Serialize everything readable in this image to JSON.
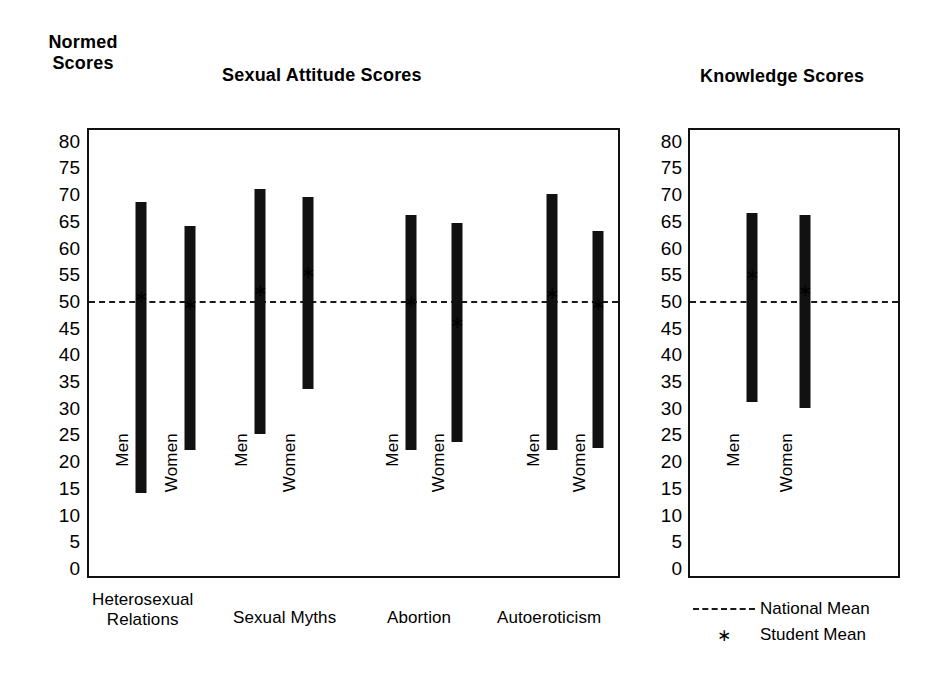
{
  "axis_title": "Normed\nScores",
  "panels": {
    "left": {
      "title": "Sexual Attitude Scores"
    },
    "right": {
      "title": "Knowledge Scores"
    }
  },
  "legend": {
    "national": {
      "label": "National Mean",
      "key": "dashed-line"
    },
    "student": {
      "label": "Student Mean",
      "key": "∗"
    }
  },
  "group_labels": {
    "men": "Men",
    "women": "Women"
  },
  "chart_data": {
    "type": "bar",
    "title": "Normed Scores",
    "ylabel": "Normed Scores",
    "xlabel": "",
    "ylim": [
      0,
      82
    ],
    "grid": false,
    "legend_position": "bottom-right",
    "yticks": [
      80,
      75,
      70,
      65,
      60,
      55,
      50,
      45,
      40,
      35,
      30,
      25,
      20,
      15,
      10,
      5,
      0
    ],
    "national_mean": 50,
    "panels": [
      {
        "name": "Sexual Attitude Scores",
        "categories": [
          "Heterosexual\nRelations",
          "Sexual Myths",
          "Abortion",
          "Autoeroticism"
        ],
        "series": [
          {
            "name": "Men",
            "ranges": [
              [
                14,
                68.5
              ],
              [
                25,
                71
              ],
              [
                22,
                66
              ],
              [
                22,
                70
              ]
            ],
            "student_means": [
              51,
              52,
              50,
              51.5
            ]
          },
          {
            "name": "Women",
            "ranges": [
              [
                22,
                64
              ],
              [
                33.5,
                69.5
              ],
              [
                23.5,
                64.5
              ],
              [
                22.5,
                63
              ]
            ],
            "student_means": [
              49.5,
              55.5,
              46,
              49.5
            ]
          }
        ]
      },
      {
        "name": "Knowledge Scores",
        "categories": [
          "Knowledge"
        ],
        "series": [
          {
            "name": "Men",
            "ranges": [
              [
                31,
                66.5
              ]
            ],
            "student_means": [
              55
            ]
          },
          {
            "name": "Women",
            "ranges": [
              [
                30,
                66
              ]
            ],
            "student_means": [
              52
            ]
          }
        ]
      }
    ]
  }
}
